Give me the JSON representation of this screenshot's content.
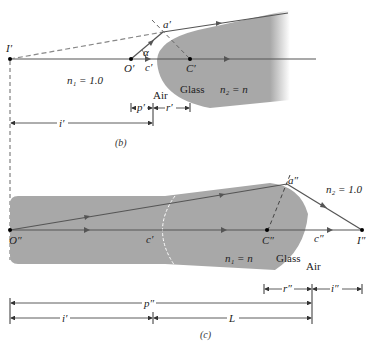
{
  "panel_b": {
    "caption": "(b)",
    "points": {
      "I": "I′",
      "O": "O′",
      "a": "a′",
      "c": "c′",
      "C": "C′"
    },
    "angle": "α",
    "n1": "n₁ = 1.0",
    "n2": "n₂ = n",
    "air": "Air",
    "glass": "Glass",
    "dims": {
      "p": "p′",
      "r": "r′",
      "i": "i′"
    }
  },
  "panel_c": {
    "caption": "(c)",
    "points": {
      "O": "O″",
      "a": "a″",
      "c1": "c′",
      "C": "C″",
      "c2": "c″",
      "I": "I″"
    },
    "n1": "n₁ = n",
    "n2": "n₂ = 1.0",
    "air": "Air",
    "glass": "Glass",
    "dims": {
      "r": "r″",
      "i2": "i″",
      "p": "p″",
      "i": "i′",
      "L": "L"
    }
  },
  "colors": {
    "glass": "#a8a8a8",
    "ray": "#555555",
    "dim": "#333333"
  }
}
